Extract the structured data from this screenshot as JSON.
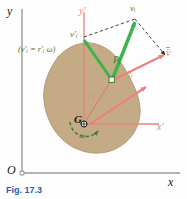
{
  "figure": {
    "caption": "Fig. 17.3",
    "domain_note": "rigid-body kinematics diagram"
  },
  "axes": {
    "fixed": {
      "origin_label": "O",
      "x_label": "x",
      "y_label": "y",
      "color": "#9a9a9a"
    },
    "centroidal": {
      "origin_label": "G",
      "x_label": "x′",
      "y_label": "y′",
      "color": "#e6857a"
    }
  },
  "body": {
    "name": "rigid-body-slab",
    "fill": "#c4ab86",
    "stroke": "#b09a77"
  },
  "points": [
    {
      "id": "G",
      "label": "G",
      "color": "#1a1a1a"
    },
    {
      "id": "Pi",
      "label": "Pᵢ",
      "color": "#3f7a3a"
    }
  ],
  "vectors": [
    {
      "id": "v_i",
      "label": "vᵢ",
      "color": "#3bb54a",
      "style": "solid",
      "desc": "absolute velocity of particle Pi"
    },
    {
      "id": "v_i_prime",
      "label": "v′ᵢ",
      "color": "#3bb54a",
      "style": "solid",
      "desc": "relative velocity of Pi with respect to G"
    },
    {
      "id": "v_bar_G",
      "label": "v̄",
      "color": "#e6857a",
      "style": "solid",
      "desc": "velocity of mass center G"
    },
    {
      "id": "v_bar_tip",
      "label": "v̄",
      "color": "#e6857a",
      "style": "solid",
      "desc": "translated velocity of mass center at Pi"
    }
  ],
  "annotations": {
    "relative_speed": "(v′ᵢ = r′ᵢ ω)",
    "position_vector": "r′ᵢ",
    "angular_velocity": "ω"
  },
  "colors": {
    "green": "#3bb54a",
    "dark_green": "#3f7a3a",
    "salmon": "#e6857a",
    "body_tan": "#c4ab86",
    "axis_gray": "#9a9a9a",
    "caption_blue": "#2a5fa8",
    "dashed_black": "#2b2b2b"
  }
}
